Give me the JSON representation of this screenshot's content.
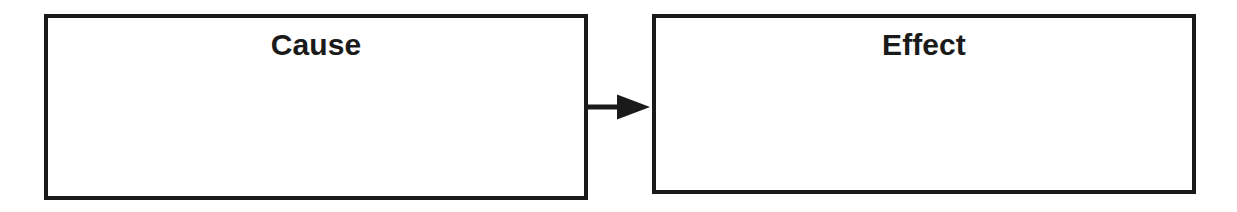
{
  "diagram": {
    "type": "cause-effect-flow",
    "canvas": {
      "width": 1237,
      "height": 212,
      "background_color": "#ffffff"
    },
    "style": {
      "border_color": "#1a1a1a",
      "border_width_px": 4,
      "text_color": "#1a1a1a",
      "fill_color": "#ffffff",
      "label_font_size_px": 30,
      "label_font_weight": "bold"
    },
    "nodes": [
      {
        "id": "cause",
        "label": "Cause",
        "x": 44,
        "y": 14,
        "width": 544,
        "height": 186
      },
      {
        "id": "effect",
        "label": "Effect",
        "x": 652,
        "y": 14,
        "width": 544,
        "height": 180
      }
    ],
    "connectors": [
      {
        "id": "cause-to-effect",
        "icon": "arrow-right-icon",
        "from": "cause",
        "to": "effect",
        "label": "",
        "direction": "right",
        "color": "#1a1a1a"
      }
    ]
  }
}
